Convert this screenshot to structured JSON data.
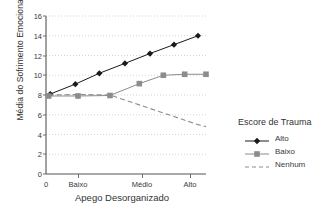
{
  "chart_data": {
    "type": "line",
    "title": "",
    "xlabel": "Apego Desorganizado",
    "ylabel": "Média do Sofrimento Emocional Geral",
    "xlim": [
      0,
      3
    ],
    "ylim": [
      0,
      16
    ],
    "ytick_labels": [
      "0",
      "2",
      "4",
      "6",
      "8",
      "10",
      "12",
      "14",
      "16"
    ],
    "ytick_values": [
      0,
      2,
      4,
      6,
      8,
      10,
      12,
      14,
      16
    ],
    "xtick_labels": [
      "0",
      "Baixo",
      "Médio",
      "Alto"
    ],
    "xtick_values": [
      0,
      0.6,
      1.8,
      2.7
    ],
    "grid": "horizontal-dotted",
    "legend_position": "right",
    "legend_title": "Escore de Trauma",
    "series": [
      {
        "name": "Alto",
        "marker": "diamond",
        "line": "solid",
        "color": "#1a1a1a",
        "x": [
          0.08,
          0.55,
          1.0,
          1.48,
          1.95,
          2.4,
          2.85
        ],
        "values": [
          8.1,
          9.1,
          10.2,
          11.2,
          12.2,
          13.1,
          14.0
        ]
      },
      {
        "name": "Baixo",
        "marker": "square",
        "line": "solid",
        "color": "#8c8c8c",
        "x": [
          0.05,
          0.6,
          1.2,
          1.75,
          2.2,
          2.6,
          3.0
        ],
        "values": [
          7.9,
          7.9,
          7.95,
          9.15,
          10.0,
          10.1,
          10.1
        ]
      },
      {
        "name": "Nenhum",
        "marker": "none",
        "line": "dashed",
        "color": "#8c8c8c",
        "x": [
          0.05,
          0.6,
          1.2,
          1.75,
          2.3,
          2.85,
          3.0
        ],
        "values": [
          8.0,
          8.05,
          8.0,
          7.0,
          6.0,
          5.0,
          4.8
        ]
      }
    ]
  },
  "caption": ""
}
